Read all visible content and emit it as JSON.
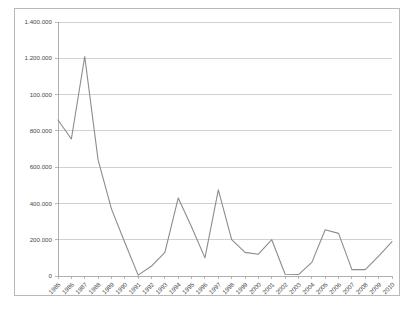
{
  "chart_data": {
    "type": "line",
    "title": "",
    "subtitle": "",
    "xlabel": "",
    "ylabel": "",
    "grid": true,
    "legend_position": "none",
    "ylim": [
      0,
      1400000
    ],
    "ytick_labels": [
      "1.400.000",
      "1.200.000",
      "100.000",
      "800.000",
      "600.000",
      "400.000",
      "200.000",
      "0"
    ],
    "ytick_values": [
      1400000,
      1200000,
      1000000,
      800000,
      600000,
      400000,
      200000,
      0
    ],
    "categories": [
      "1985",
      "1986",
      "1987",
      "1988",
      "1989",
      "1990",
      "1991",
      "1992",
      "1993",
      "1994",
      "1995",
      "1996",
      "1997",
      "1998",
      "1999",
      "2000",
      "2001",
      "2002",
      "2003",
      "2004",
      "2005",
      "2006",
      "2007",
      "2008",
      "2009",
      "2010"
    ],
    "series": [
      {
        "name": "",
        "color": "#8c8c8c",
        "values": [
          860000,
          755000,
          1210000,
          640000,
          370000,
          185000,
          5000,
          55000,
          130000,
          430000,
          270000,
          100000,
          475000,
          200000,
          130000,
          120000,
          200000,
          10000,
          8000,
          75000,
          255000,
          235000,
          35000,
          35000,
          110000,
          190000
        ]
      }
    ],
    "colors": {
      "line": "#8c8c8c",
      "grid": "#bdbdbd",
      "axis": "#9a9a9a",
      "frame": "#b9b9b9",
      "text": "#4a4a4a",
      "background": "#ffffff"
    }
  }
}
